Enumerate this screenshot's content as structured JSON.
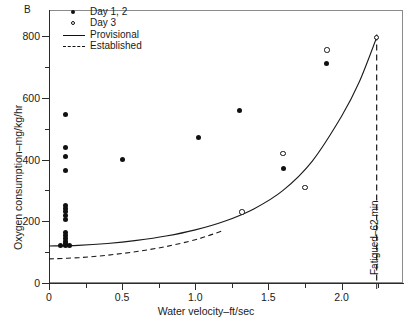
{
  "panel_letter": "B",
  "legend": {
    "items": [
      {
        "key": "filled-circle",
        "label": "Day 1, 2"
      },
      {
        "key": "open-circle",
        "label": "Day 3"
      },
      {
        "key": "solid-line",
        "label": "Provisional"
      },
      {
        "key": "dashed-line",
        "label": "Established"
      }
    ]
  },
  "annotation": {
    "fatigue_label": "Fatigued–62 min",
    "fatigue_x": 2.24
  },
  "colors": {
    "ink": "#1a1a1a",
    "marker": "#111111",
    "frame": "#8a8a8a",
    "axis": "#2b2b2b",
    "background": "#ffffff"
  },
  "chart_data": {
    "type": "scatter",
    "title": "",
    "subtitle": "",
    "xlabel": "Water velocity–ft/sec",
    "ylabel": "Oxygen consumption–mg/kg/hr",
    "xlim": [
      0,
      2.42
    ],
    "ylim": [
      0,
      880
    ],
    "xticks": [
      0,
      0.5,
      1.0,
      1.5,
      2.0
    ],
    "xticklabels": [
      "0",
      "0.5",
      "1.0",
      "1.5",
      "2.0"
    ],
    "xticks_minor": [
      0.25,
      0.75,
      1.25,
      1.75,
      2.25
    ],
    "yticks": [
      0,
      200,
      400,
      600,
      800
    ],
    "yticklabels": [
      "0",
      "200",
      "400",
      "600",
      "800"
    ],
    "yticks_minor": [
      100,
      300,
      500,
      700
    ],
    "grid": false,
    "legend_position": "top-left",
    "series": [
      {
        "name": "Day 1, 2",
        "marker": "filled-circle",
        "points": [
          [
            0.11,
            545
          ],
          [
            0.11,
            440
          ],
          [
            0.11,
            410
          ],
          [
            0.11,
            365
          ],
          [
            0.11,
            250
          ],
          [
            0.11,
            240
          ],
          [
            0.11,
            230
          ],
          [
            0.11,
            220
          ],
          [
            0.11,
            205
          ],
          [
            0.11,
            165
          ],
          [
            0.11,
            155
          ],
          [
            0.11,
            145
          ],
          [
            0.11,
            135
          ],
          [
            0.11,
            128
          ],
          [
            0.11,
            122
          ],
          [
            0.08,
            120
          ],
          [
            0.14,
            120
          ],
          [
            0.5,
            400
          ],
          [
            1.02,
            470
          ],
          [
            1.3,
            560
          ],
          [
            1.6,
            372
          ],
          [
            1.9,
            710
          ]
        ]
      },
      {
        "name": "Day 3",
        "marker": "open-circle",
        "points": [
          [
            1.32,
            230
          ],
          [
            1.6,
            420
          ],
          [
            1.75,
            310
          ],
          [
            1.9,
            755
          ],
          [
            2.24,
            795
          ]
        ]
      }
    ],
    "curves": [
      {
        "name": "Provisional",
        "style": "solid",
        "points": [
          [
            0.0,
            120
          ],
          [
            0.2,
            122
          ],
          [
            0.4,
            128
          ],
          [
            0.6,
            138
          ],
          [
            0.8,
            152
          ],
          [
            1.0,
            172
          ],
          [
            1.2,
            200
          ],
          [
            1.4,
            240
          ],
          [
            1.6,
            300
          ],
          [
            1.8,
            395
          ],
          [
            2.0,
            540
          ],
          [
            2.12,
            650
          ],
          [
            2.24,
            795
          ]
        ]
      },
      {
        "name": "Established",
        "style": "dashed",
        "points": [
          [
            0.0,
            78
          ],
          [
            0.2,
            82
          ],
          [
            0.4,
            90
          ],
          [
            0.6,
            102
          ],
          [
            0.8,
            118
          ],
          [
            1.0,
            140
          ],
          [
            1.1,
            155
          ],
          [
            1.18,
            168
          ]
        ]
      }
    ]
  }
}
